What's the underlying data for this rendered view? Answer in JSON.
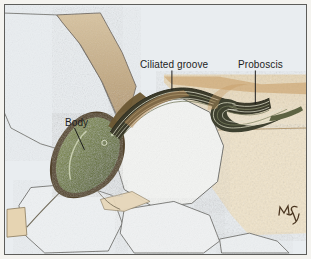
{
  "figure": {
    "kind": "scientific-illustration",
    "frame_color": "#5d5d5a",
    "outer_background": "#ffffff"
  },
  "labels": [
    {
      "id": "ciliated-groove",
      "text": "Ciliated groove",
      "leader": "vertical-down"
    },
    {
      "id": "proboscis",
      "text": "Proboscis",
      "leader": "vertical-down"
    },
    {
      "id": "body",
      "text": "Body",
      "leader": "diagonal-down-right"
    }
  ],
  "signature": {
    "text": "MSJ",
    "style": "handwritten-monogram",
    "color": "#4a3520"
  },
  "palette": {
    "sand_grain_pale": "#e9edf0",
    "sand_grain_white": "#f3f4f2",
    "sand_grain_tan": "#cbb694",
    "sediment_light": "#efe3cb",
    "sediment_mid": "#d9bf96",
    "sediment_dark": "#b08a58",
    "body_green": "#6f7d3d",
    "body_green_dark": "#4e5a26",
    "body_outline": "#4a3a22",
    "groove_dark": "#3b3a2a",
    "groove_light": "#d8d8c4",
    "grain_outline": "#6a6a66",
    "label_text": "#1d1d1d"
  },
  "anatomy": {
    "body": {
      "shape": "spindle",
      "texture": "stippled-olive-green"
    },
    "ciliated_groove": {
      "shape": "long-striated-ribbon",
      "stripes": 5
    },
    "proboscis": {
      "shape": "curled-hook-tip",
      "stripes": 6
    }
  }
}
